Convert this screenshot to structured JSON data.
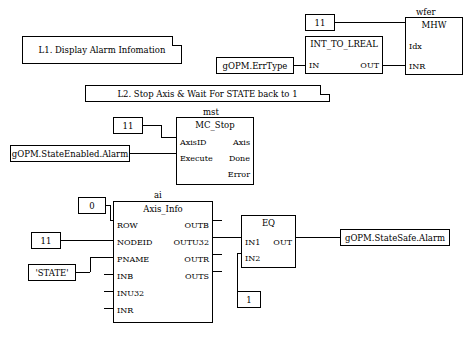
{
  "diagram": {
    "comments": [
      {
        "id": "c1",
        "text": "L1. Display Alarm Infomation"
      },
      {
        "id": "c2",
        "text": "L2. Stop Axis & Wait For STATE back to 1"
      }
    ],
    "blocks": [
      {
        "id": "wfer",
        "instance": "wfer",
        "title": "MHW",
        "inputs": [
          "Idx"
        ],
        "outputs": [
          "INR"
        ]
      },
      {
        "id": "conv",
        "instance": "",
        "title": "INT_TO_LREAL",
        "inputs": [
          "IN"
        ],
        "outputs": [
          "OUT"
        ]
      },
      {
        "id": "mst",
        "instance": "mst",
        "title": "MC_Stop",
        "inputs": [
          "AxisID",
          "Execute"
        ],
        "outputs": [
          "Axis",
          "Done",
          "Error"
        ]
      },
      {
        "id": "ai",
        "instance": "ai",
        "title": "Axis_Info",
        "inputs": [
          "ROW",
          "NODEID",
          "PNAME",
          "INB",
          "INU32",
          "INR"
        ],
        "outputs": [
          "OUTB",
          "OUTU32",
          "OUTR",
          "OUTS"
        ]
      },
      {
        "id": "eq",
        "instance": "",
        "title": "EQ",
        "inputs": [
          "IN1",
          "IN2"
        ],
        "outputs": [
          "OUT"
        ]
      }
    ],
    "variables": [
      {
        "id": "v_errtype",
        "text": "gOPM.ErrType"
      },
      {
        "id": "v_const11_top",
        "text": "11"
      },
      {
        "id": "v_const11_mst",
        "text": "11"
      },
      {
        "id": "v_stateenabled",
        "text": "gOPM.StateEnabled.Alarm"
      },
      {
        "id": "v_const0",
        "text": "0"
      },
      {
        "id": "v_const11_ai",
        "text": "11"
      },
      {
        "id": "v_state",
        "text": "'STATE'"
      },
      {
        "id": "v_const1",
        "text": "1"
      },
      {
        "id": "v_statesafe",
        "text": "gOPM.StateSafe.Alarm"
      }
    ]
  }
}
